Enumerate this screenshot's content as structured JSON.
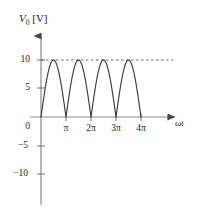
{
  "chart_data": {
    "type": "line",
    "title": "",
    "subtitle": "",
    "xlabel": "ωt",
    "ylabel": "V₀ [V]",
    "ylabel_symbol": "V",
    "ylabel_subscript": "0",
    "ylabel_unit": "[V]",
    "xlim": [
      0,
      13.9
    ],
    "ylim": [
      -11.8,
      11.6
    ],
    "grid": false,
    "legend": null,
    "xtick_labels": [
      "0",
      "π",
      "2π",
      "3π",
      "4π"
    ],
    "xtick_values": [
      0,
      3.14159,
      6.28319,
      9.42478,
      12.56637
    ],
    "ytick_labels": [
      "10",
      "5",
      "0",
      "−5",
      "−10"
    ],
    "ytick_values": [
      10,
      5,
      0,
      -5,
      -10
    ],
    "series": [
      {
        "name": "rectified-sine",
        "type": "line",
        "color": "#3b3b3b",
        "amplitude": 10,
        "period": 3.14159,
        "x_start": 0,
        "x_end": 12.56637,
        "peak_value": 10,
        "min_value": 0,
        "peak_x_values": [
          1.5708,
          4.71239,
          7.85398,
          10.99557
        ],
        "zero_x_values": [
          0,
          3.14159,
          6.28319,
          9.42478,
          12.56637
        ]
      }
    ],
    "annotations": [
      {
        "name": "peak-reference-line",
        "type": "hline",
        "value": 10,
        "style": "dashed",
        "color": "#4a4a4a",
        "x_start": 0,
        "x_end": 13.6
      }
    ],
    "axis_color": "#6e6e6e",
    "curve_color": "#3b3b3b",
    "background_color": "#ffffff"
  }
}
